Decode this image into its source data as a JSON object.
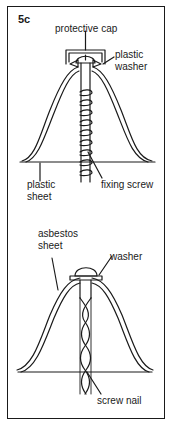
{
  "figure": {
    "id": "5c",
    "top_diagram": {
      "labels": {
        "protective_cap": "protective cap",
        "plastic_washer_1": "plastic",
        "plastic_washer_2": "washer",
        "plastic_sheet_1": "plastic",
        "plastic_sheet_2": "sheet",
        "fixing_screw": "fixing screw"
      }
    },
    "bottom_diagram": {
      "labels": {
        "asbestos_sheet_1": "asbestos",
        "asbestos_sheet_2": "sheet",
        "washer": "washer",
        "screw_nail": "screw nail"
      }
    }
  },
  "colors": {
    "ink": "#1a1a1a",
    "background": "#ffffff"
  }
}
